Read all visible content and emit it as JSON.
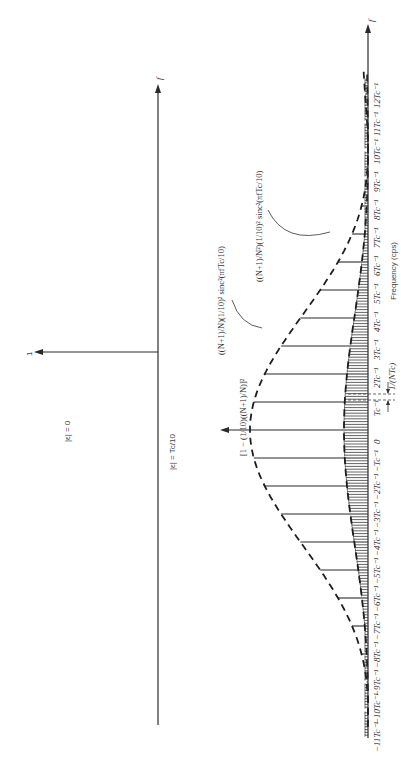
{
  "figure": {
    "orientation": "rotated-90-ccw",
    "top_panel": {
      "label": "|ε| = 0",
      "axis_label": "f",
      "impulse_label": "1"
    },
    "bottom_panel": {
      "label": "|ε| = Tc/10",
      "axis_label": "f",
      "x_axis_title": "Frequency (cps)",
      "tick_labels": [
        "−11Tc⁻¹",
        "−10Tc⁻¹",
        "−9Tc⁻¹",
        "−8Tc⁻¹",
        "−7Tc⁻¹",
        "−6Tc⁻¹",
        "−5Tc⁻¹",
        "−4Tc⁻¹",
        "−3Tc⁻¹",
        "−2Tc⁻¹",
        "−Tc⁻¹",
        "0",
        "Tc⁻¹",
        "2Tc⁻¹",
        "3Tc⁻¹",
        "4Tc⁻¹",
        "5Tc⁻¹",
        "6Tc⁻¹",
        "7Tc⁻¹",
        "8Tc⁻¹",
        "9Tc⁻¹",
        "10Tc⁻¹",
        "11Tc⁻¹",
        "12Tc⁻¹"
      ],
      "spacing_label": "1/(NTc)",
      "annotations": {
        "dc_term": "[1 − (1/10)((N+1)/N)]²",
        "upper_envelope": "((N+1)/N)(1/10)² sinc²(πfTc/10)",
        "lower_envelope": "((N+1)/N²)(1/10)² sinc²(πfTc/10)"
      }
    }
  }
}
